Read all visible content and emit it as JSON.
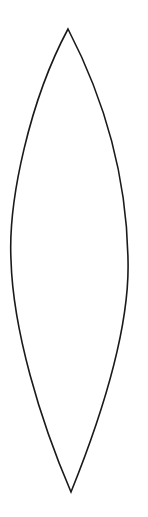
{
  "figure": {
    "shape": "vesica-lens",
    "stroke_color": "#1a1a1a",
    "background": "#ffffff",
    "top_point": [
      68,
      29
    ],
    "bottom_point": [
      71,
      492
    ],
    "left_extent_x": 11,
    "right_extent_x": 128
  }
}
